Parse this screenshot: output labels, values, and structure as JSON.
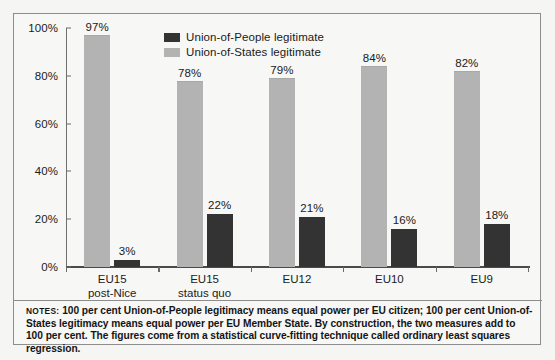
{
  "chart_data": {
    "type": "bar",
    "title": "",
    "subtitle": "",
    "xlabel": "",
    "ylabel": "",
    "ylim": [
      0,
      100
    ],
    "yticks": [
      "0%",
      "20%",
      "40%",
      "60%",
      "80%",
      "100%"
    ],
    "ytick_values": [
      0,
      20,
      40,
      60,
      80,
      100
    ],
    "grid": false,
    "legend_position": "top-center",
    "categories": [
      "EU15 post-Nice",
      "EU15 status quo",
      "EU12",
      "EU10",
      "EU9"
    ],
    "category_lines": [
      [
        "EU15",
        "post-Nice"
      ],
      [
        "EU15",
        "status quo"
      ],
      [
        "EU12",
        ""
      ],
      [
        "EU10",
        ""
      ],
      [
        "EU9",
        ""
      ]
    ],
    "series": [
      {
        "name": "Union-of-People legitimate",
        "color": "#333333",
        "values": [
          3,
          22,
          21,
          16,
          18
        ],
        "labels": [
          "3%",
          "22%",
          "21%",
          "16%",
          "18%"
        ]
      },
      {
        "name": "Union-of-States legitimate",
        "color": "#b3b3b3",
        "values": [
          97,
          78,
          79,
          84,
          82
        ],
        "labels": [
          "97%",
          "78%",
          "79%",
          "84%",
          "82%"
        ]
      }
    ],
    "series_draw_order": [
      "Union-of-States legitimate",
      "Union-of-People legitimate"
    ]
  },
  "legend": {
    "items": [
      {
        "label": "Union-of-People legitimate",
        "swatch": "people"
      },
      {
        "label": "Union-of-States legitimate",
        "swatch": "states"
      }
    ]
  },
  "notes": {
    "label": "NOTES:",
    "text": "100 per cent Union-of-People legitimacy means equal power per EU citizen; 100 per cent Union-of-States legitimacy means equal power per EU Member State. By construction, the two measures add to 100 per cent. The figures come from a statistical curve-fitting technique called ordinary least squares regression."
  },
  "colors": {
    "people": "#333333",
    "states": "#b3b3b3",
    "frame": "#8d8d8d",
    "axis": "#4a4a4a",
    "page": "#f5f5f3"
  }
}
